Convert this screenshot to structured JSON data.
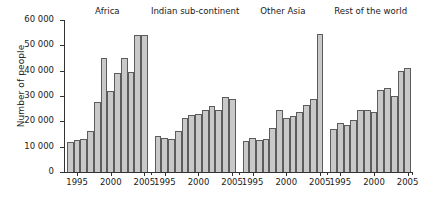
{
  "chart_data": {
    "type": "bar",
    "title": "",
    "xlabel": "",
    "ylabel": "Number of people",
    "ylim": [
      0,
      60000
    ],
    "ytick_values": [
      0,
      10000,
      20000,
      30000,
      40000,
      50000,
      60000
    ],
    "ytick_labels": [
      "0",
      "10 000",
      "20 000",
      "30 000",
      "40 000",
      "50 000",
      "60 000"
    ],
    "grid": false,
    "legend": "none",
    "x": [
      1994,
      1995,
      1996,
      1997,
      1998,
      1999,
      2000,
      2001,
      2002,
      2003,
      2004,
      2005
    ],
    "xtick_labels": [
      "1995",
      "2000",
      "2005"
    ],
    "xtick_years": [
      1995,
      2000,
      2005
    ],
    "groups": [
      {
        "name": "Africa",
        "categories": [
          1994,
          1995,
          1996,
          1997,
          1998,
          1999,
          2000,
          2001,
          2002,
          2003,
          2004,
          2005
        ],
        "values": [
          12000,
          12800,
          13000,
          16000,
          27500,
          45000,
          32000,
          39000,
          45000,
          39500,
          54000,
          54000
        ]
      },
      {
        "name": "Indian sub-continent",
        "categories": [
          1994,
          1995,
          1996,
          1997,
          1998,
          1999,
          2000,
          2001,
          2002,
          2003,
          2004,
          2005
        ],
        "values": [
          14300,
          13500,
          13200,
          16200,
          21200,
          22500,
          22800,
          24300,
          26200,
          24500,
          29500,
          29000
        ]
      },
      {
        "name": "Other Asia",
        "categories": [
          1994,
          1995,
          1996,
          1997,
          1998,
          1999,
          2000,
          2001,
          2002,
          2003,
          2004,
          2005
        ],
        "values": [
          12200,
          13500,
          12500,
          13200,
          17500,
          24500,
          21500,
          22000,
          23500,
          26500,
          29000,
          54500
        ]
      },
      {
        "name": "Rest of the world",
        "categories": [
          1994,
          1995,
          1996,
          1997,
          1998,
          1999,
          2000,
          2001,
          2002,
          2003,
          2004,
          2005
        ],
        "values": [
          16800,
          19500,
          18500,
          20500,
          24500,
          24500,
          23500,
          32500,
          33000,
          30000,
          40000,
          41000
        ]
      }
    ]
  }
}
